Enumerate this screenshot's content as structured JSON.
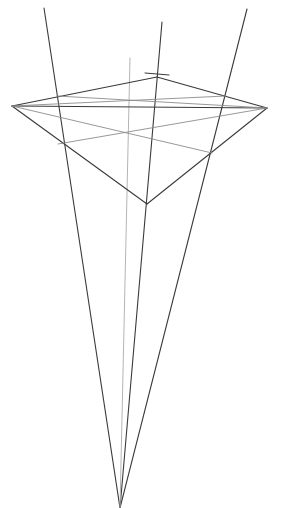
{
  "diagram": {
    "type": "three-point-perspective-sketch",
    "width": 282,
    "height": 508,
    "background": "#ffffff",
    "colors": {
      "dark": "#3a3a3a",
      "gray": "#8c8c8c",
      "light": "#b4b4b4"
    },
    "points": {
      "vanishing_bottom": [
        120,
        508
      ],
      "left_vertex": [
        12,
        106
      ],
      "top_vertex": [
        157,
        77
      ],
      "right_vertex": [
        267,
        108
      ],
      "bottom_vertex": [
        147,
        204
      ]
    },
    "lines": [
      {
        "id": "converging-left",
        "from": [
          44,
          8
        ],
        "to": [
          120,
          508
        ],
        "stroke": "dark",
        "width": 1.1
      },
      {
        "id": "converging-middle",
        "from": [
          162,
          22
        ],
        "to": [
          120,
          508
        ],
        "stroke": "dark",
        "width": 1.1
      },
      {
        "id": "converging-right",
        "from": [
          247,
          9
        ],
        "to": [
          120,
          508
        ],
        "stroke": "dark",
        "width": 1.1
      },
      {
        "id": "converging-center-guide",
        "from": [
          130,
          58
        ],
        "to": [
          120,
          508
        ],
        "stroke": "light",
        "width": 1.0
      },
      {
        "id": "edge-left-top",
        "from": [
          12,
          106
        ],
        "to": [
          157,
          77
        ],
        "stroke": "dark",
        "width": 1.1
      },
      {
        "id": "edge-top-right",
        "from": [
          157,
          77
        ],
        "to": [
          267,
          108
        ],
        "stroke": "dark",
        "width": 1.1
      },
      {
        "id": "edge-left-bottom",
        "from": [
          12,
          106
        ],
        "to": [
          147,
          204
        ],
        "stroke": "dark",
        "width": 1.1
      },
      {
        "id": "edge-bottom-right",
        "from": [
          147,
          204
        ],
        "to": [
          267,
          108
        ],
        "stroke": "dark",
        "width": 1.1
      },
      {
        "id": "horizon-line",
        "from": [
          12,
          106
        ],
        "to": [
          267,
          108
        ],
        "stroke": "dark",
        "width": 1.1
      },
      {
        "id": "top-tick",
        "from": [
          145,
          73
        ],
        "to": [
          169,
          75
        ],
        "stroke": "dark",
        "width": 1.0
      },
      {
        "id": "guide-upper-left",
        "from": [
          57,
          96
        ],
        "to": [
          267,
          108
        ],
        "stroke": "gray",
        "width": 0.9
      },
      {
        "id": "guide-upper-right",
        "from": [
          12,
          106
        ],
        "to": [
          226,
          96
        ],
        "stroke": "gray",
        "width": 0.9
      },
      {
        "id": "guide-diagonal-down-right",
        "from": [
          12,
          106
        ],
        "to": [
          212,
          153
        ],
        "stroke": "gray",
        "width": 0.9
      },
      {
        "id": "guide-diagonal-down-left",
        "from": [
          267,
          108
        ],
        "to": [
          58,
          144
        ],
        "stroke": "gray",
        "width": 0.9
      }
    ]
  }
}
